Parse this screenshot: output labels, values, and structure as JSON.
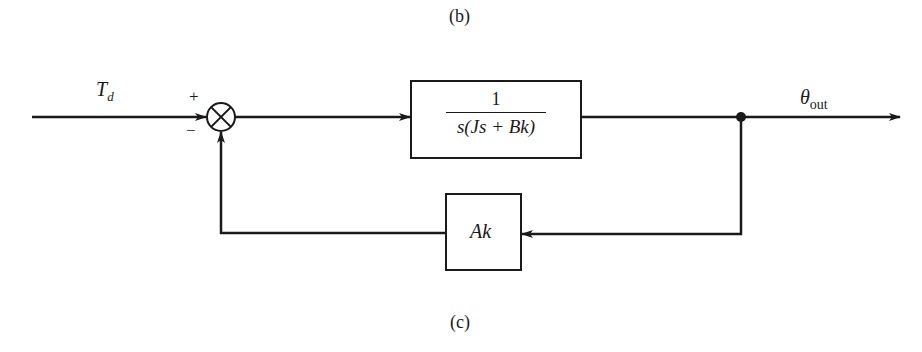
{
  "captions": {
    "top": "(b)",
    "bottom": "(c)"
  },
  "diagram": {
    "type": "block-diagram",
    "input": {
      "label_main": "T",
      "label_sub": "d"
    },
    "summing_junction": {
      "plus_sign": "+",
      "minus_sign": "−",
      "symbol": "multiplication-cross-circle"
    },
    "forward_block": {
      "numerator": "1",
      "denominator": "s(Js + Bk)"
    },
    "feedback_block": {
      "label": "Ak"
    },
    "output": {
      "label_main": "θ",
      "label_sub": "out"
    }
  },
  "colors": {
    "line": "#1a1a1a",
    "background": "#ffffff"
  }
}
